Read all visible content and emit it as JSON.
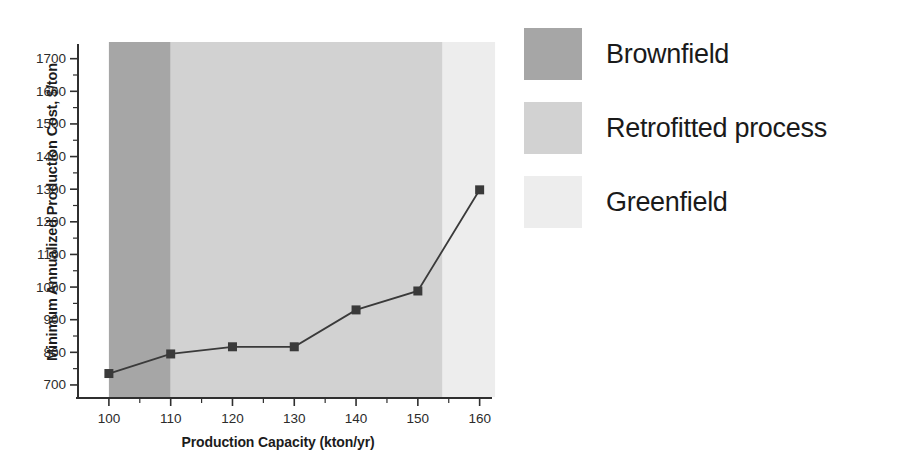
{
  "chart_data": {
    "type": "line",
    "title": "",
    "xlabel": "Production Capacity (kton/yr)",
    "ylabel": "Minimum Annualized Production Cost, $/ton",
    "x": [
      100,
      110,
      120,
      130,
      140,
      150,
      160
    ],
    "values": [
      735,
      795,
      817,
      817,
      930,
      988,
      1298
    ],
    "series": [
      {
        "name": "Minimum Annualized Production Cost",
        "x": [
          100,
          110,
          120,
          130,
          140,
          150,
          160
        ],
        "values": [
          735,
          795,
          817,
          817,
          930,
          988,
          1298
        ],
        "marker": "square",
        "color": "#3a3a3a"
      }
    ],
    "xlim": [
      95,
      162
    ],
    "ylim": [
      660,
      1745
    ],
    "xticks": [
      100,
      110,
      120,
      130,
      140,
      150,
      160
    ],
    "yticks": [
      700,
      800,
      900,
      1000,
      1100,
      1200,
      1300,
      1400,
      1500,
      1600,
      1700
    ],
    "xtick_labels": [
      "100",
      "110",
      "120",
      "130",
      "140",
      "150",
      "160"
    ],
    "ytick_labels": [
      "700",
      "800",
      "900",
      "1000",
      "1100",
      "1200",
      "1300",
      "1400",
      "1500",
      "1600",
      "1700"
    ],
    "minor_ticks": true,
    "grid": false,
    "legend_position": "right-outside",
    "shaded_bands": [
      {
        "label": "Brownfield",
        "x_start": 100,
        "x_end": 110,
        "color": "#a6a6a6"
      },
      {
        "label": "Retrofitted process",
        "x_start": 110,
        "x_end": 154,
        "color": "#d2d2d2"
      },
      {
        "label": "Greenfield",
        "x_start": 154,
        "x_end": 162.5,
        "color": "#ededed"
      }
    ]
  },
  "legend": {
    "items": [
      {
        "label": "Brownfield",
        "color": "#a6a6a6"
      },
      {
        "label": "Retrofitted process",
        "color": "#d2d2d2"
      },
      {
        "label": "Greenfield",
        "color": "#ededed"
      }
    ]
  },
  "axes": {
    "x_title": "Production Capacity (kton/yr)",
    "y_title": "Minimum Annualized Production Cost, $/ton"
  },
  "ticks": {
    "y": [
      "1700",
      "1600",
      "1500",
      "1400",
      "1300",
      "1200",
      "1100",
      "1000",
      "900",
      "800",
      "700"
    ],
    "x": [
      "100",
      "110",
      "120",
      "130",
      "140",
      "150",
      "160"
    ]
  }
}
